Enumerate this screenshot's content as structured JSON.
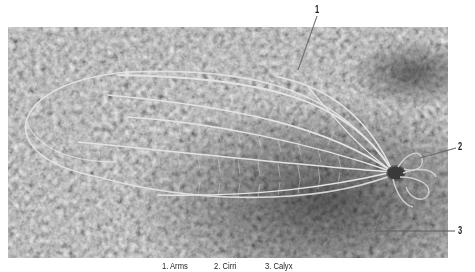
{
  "figure": {
    "callouts": [
      {
        "number": "1",
        "label": "Arms"
      },
      {
        "number": "2",
        "label": "Cirri"
      },
      {
        "number": "3",
        "label": "Calyx"
      }
    ],
    "legend": [
      {
        "text": "1. Arms"
      },
      {
        "text": "2. Cirri"
      },
      {
        "text": "3. Calyx"
      }
    ]
  }
}
